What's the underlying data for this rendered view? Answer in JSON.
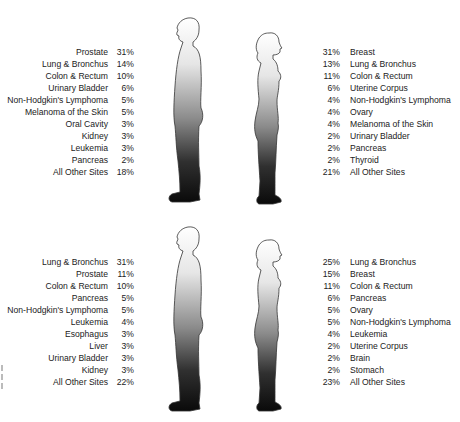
{
  "panels": [
    {
      "male": [
        {
          "label": "Prostate",
          "pct": "31%"
        },
        {
          "label": "Lung & Bronchus",
          "pct": "14%"
        },
        {
          "label": "Colon & Rectum",
          "pct": "10%"
        },
        {
          "label": "Urinary Bladder",
          "pct": "6%"
        },
        {
          "label": "Non-Hodgkin's Lymphoma",
          "pct": "5%"
        },
        {
          "label": "Melanoma of the Skin",
          "pct": "5%"
        },
        {
          "label": "Oral Cavity",
          "pct": "3%"
        },
        {
          "label": "Kidney",
          "pct": "3%"
        },
        {
          "label": "Leukemia",
          "pct": "3%"
        },
        {
          "label": "Pancreas",
          "pct": "2%"
        },
        {
          "label": "All Other Sites",
          "pct": "18%"
        }
      ],
      "female": [
        {
          "label": "Breast",
          "pct": "31%"
        },
        {
          "label": "Lung & Bronchus",
          "pct": "13%"
        },
        {
          "label": "Colon & Rectum",
          "pct": "11%"
        },
        {
          "label": "Uterine Corpus",
          "pct": "6%"
        },
        {
          "label": "Non-Hodgkin's Lymphoma",
          "pct": "4%"
        },
        {
          "label": "Ovary",
          "pct": "4%"
        },
        {
          "label": "Melanoma of the Skin",
          "pct": "4%"
        },
        {
          "label": "Urinary Bladder",
          "pct": "2%"
        },
        {
          "label": "Pancreas",
          "pct": "2%"
        },
        {
          "label": "Thyroid",
          "pct": "2%"
        },
        {
          "label": "All Other Sites",
          "pct": "21%"
        }
      ]
    },
    {
      "male": [
        {
          "label": "Lung & Bronchus",
          "pct": "31%"
        },
        {
          "label": "Prostate",
          "pct": "11%"
        },
        {
          "label": "Colon & Rectum",
          "pct": "10%"
        },
        {
          "label": "Pancreas",
          "pct": "5%"
        },
        {
          "label": "Non-Hodgkin's Lymphoma",
          "pct": "5%"
        },
        {
          "label": "Leukemia",
          "pct": "4%"
        },
        {
          "label": "Esophagus",
          "pct": "3%"
        },
        {
          "label": "Liver",
          "pct": "3%"
        },
        {
          "label": "Urinary Bladder",
          "pct": "3%"
        },
        {
          "label": "Kidney",
          "pct": "3%"
        },
        {
          "label": "All Other Sites",
          "pct": "22%"
        }
      ],
      "female": [
        {
          "label": "Lung & Bronchus",
          "pct": "25%"
        },
        {
          "label": "Breast",
          "pct": "15%"
        },
        {
          "label": "Colon & Rectum",
          "pct": "11%"
        },
        {
          "label": "Pancreas",
          "pct": "6%"
        },
        {
          "label": "Ovary",
          "pct": "5%"
        },
        {
          "label": "Non-Hodgkin's Lymphoma",
          "pct": "5%"
        },
        {
          "label": "Leukemia",
          "pct": "4%"
        },
        {
          "label": "Uterine Corpus",
          "pct": "2%"
        },
        {
          "label": "Brain",
          "pct": "2%"
        },
        {
          "label": "Stomach",
          "pct": "2%"
        },
        {
          "label": "All Other Sites",
          "pct": "23%"
        }
      ]
    }
  ],
  "icons": {
    "male": "male-silhouette-icon",
    "female": "female-silhouette-icon"
  }
}
